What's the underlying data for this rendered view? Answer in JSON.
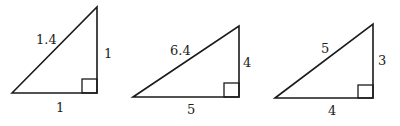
{
  "figure": {
    "triangles": [
      {
        "hypotenuse": "1.4",
        "vertical_leg": "1",
        "horizontal_leg": "1"
      },
      {
        "hypotenuse": "6.4",
        "vertical_leg": "4",
        "horizontal_leg": "5"
      },
      {
        "hypotenuse": "5",
        "vertical_leg": "3",
        "horizontal_leg": "4"
      }
    ]
  }
}
